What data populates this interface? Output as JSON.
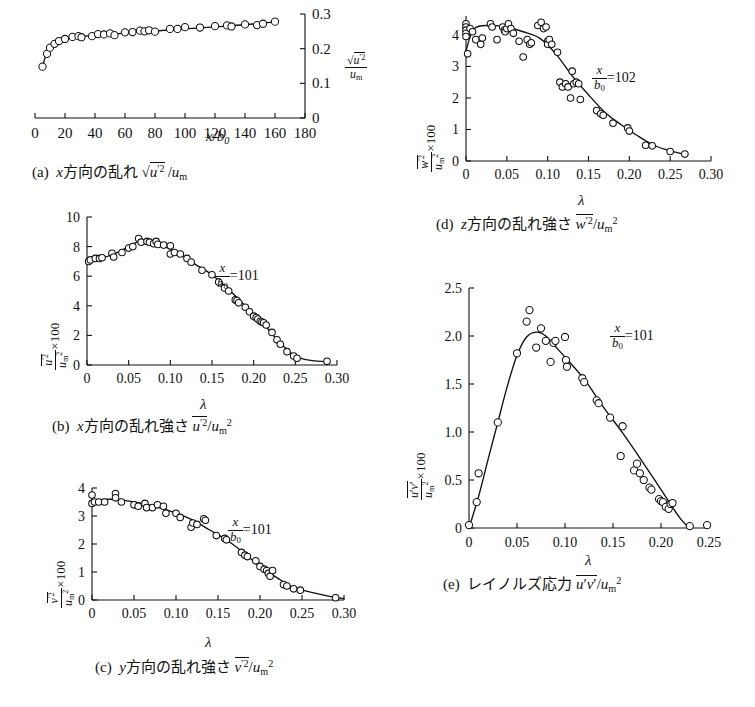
{
  "figure": {
    "background": "#ffffff",
    "line_color": "#111111",
    "marker": "open-circle",
    "width": 755,
    "height": 707
  },
  "panels": [
    {
      "id": "a",
      "caption_label": "(a)",
      "caption_text": "x方向の乱れ √u̅'² /u_m",
      "annotation": "",
      "ylabel": "√u̅'² / u_m",
      "xlabel": "x/b₀",
      "chart_data": {
        "type": "scatter",
        "title": "(a) x方向の乱れ √u'2/um",
        "xlabel": "x/b0",
        "ylabel": "sqrt(u'^2)/um",
        "xlim": [
          0,
          180
        ],
        "ylim": [
          0,
          0.3
        ],
        "xticks": [
          0,
          20,
          40,
          60,
          80,
          100,
          120,
          140,
          160,
          180
        ],
        "yticks": [
          0,
          0.1,
          0.2,
          0.3
        ],
        "grid": false,
        "legend": "none",
        "x": [
          5,
          8,
          10,
          13,
          16,
          20,
          25,
          29,
          31,
          38,
          42,
          46,
          50,
          53,
          60,
          65,
          70,
          73,
          76,
          80,
          90,
          95,
          100,
          110,
          120,
          128,
          131,
          140,
          148,
          152,
          160
        ],
        "y": [
          0.148,
          0.185,
          0.203,
          0.214,
          0.222,
          0.228,
          0.234,
          0.236,
          0.233,
          0.236,
          0.242,
          0.241,
          0.244,
          0.239,
          0.247,
          0.248,
          0.252,
          0.25,
          0.253,
          0.249,
          0.257,
          0.257,
          0.262,
          0.261,
          0.265,
          0.267,
          0.264,
          0.27,
          0.268,
          0.272,
          0.278
        ],
        "fit_x": [
          5,
          10,
          20,
          30,
          40,
          60,
          80,
          100,
          120,
          140,
          160
        ],
        "fit_y": [
          0.15,
          0.205,
          0.228,
          0.234,
          0.239,
          0.245,
          0.251,
          0.257,
          0.263,
          0.269,
          0.277
        ]
      }
    },
    {
      "id": "b",
      "caption_label": "(b)",
      "caption_text": "x方向の乱れ強さ u̅'²/u_m²",
      "annotation": "x/b₀ = 101",
      "annotation_value": "101",
      "ylabel": "u̅'²/u_m² ×100",
      "xlabel": "λ",
      "chart_data": {
        "type": "scatter",
        "title": "(b) x方向の乱れ強さ u'2/um2",
        "xlabel": "λ",
        "ylabel": "u'^2/um^2 x100",
        "xlim": [
          0,
          0.3
        ],
        "ylim": [
          0,
          10
        ],
        "xticks": [
          0,
          0.05,
          0.1,
          0.15,
          0.2,
          0.25,
          0.3
        ],
        "yticks": [
          0,
          2,
          4,
          6,
          8,
          10
        ],
        "grid": false,
        "legend": "none",
        "x": [
          0.002,
          0.004,
          0.01,
          0.015,
          0.018,
          0.03,
          0.032,
          0.042,
          0.05,
          0.055,
          0.062,
          0.065,
          0.072,
          0.075,
          0.08,
          0.083,
          0.085,
          0.092,
          0.1,
          0.1,
          0.105,
          0.112,
          0.12,
          0.125,
          0.138,
          0.15,
          0.158,
          0.165,
          0.17,
          0.178,
          0.18,
          0.182,
          0.19,
          0.195,
          0.2,
          0.203,
          0.205,
          0.208,
          0.21,
          0.212,
          0.215,
          0.222,
          0.228,
          0.232,
          0.24,
          0.248,
          0.252,
          0.288
        ],
        "y": [
          7.0,
          7.1,
          7.2,
          7.2,
          7.25,
          7.55,
          7.3,
          7.6,
          7.9,
          8.0,
          8.55,
          8.3,
          8.35,
          8.3,
          8.2,
          8.35,
          8.15,
          8.1,
          8.05,
          7.5,
          7.6,
          7.5,
          7.2,
          6.95,
          6.4,
          6.1,
          5.6,
          5.2,
          5.0,
          4.4,
          4.35,
          4.2,
          3.9,
          3.6,
          3.3,
          3.2,
          3.1,
          2.95,
          2.9,
          2.85,
          2.7,
          2.2,
          1.7,
          1.4,
          0.9,
          0.6,
          0.45,
          0.25
        ],
        "fit_x": [
          0,
          0.02,
          0.04,
          0.06,
          0.075,
          0.09,
          0.11,
          0.13,
          0.15,
          0.17,
          0.19,
          0.21,
          0.23,
          0.25,
          0.27,
          0.29
        ],
        "fit_y": [
          7.0,
          7.25,
          7.7,
          8.3,
          8.4,
          8.1,
          7.5,
          6.8,
          6.1,
          5.1,
          4.0,
          2.9,
          1.6,
          0.6,
          0.3,
          0.22
        ]
      }
    },
    {
      "id": "c",
      "caption_label": "(c)",
      "caption_text": "y方向の乱れ強さ v̅'²/u_m²",
      "annotation": "x/b₀ = 101",
      "annotation_value": "101",
      "ylabel": "v̅'²/u_m² ×100",
      "xlabel": "λ",
      "chart_data": {
        "type": "scatter",
        "title": "(c) y方向の乱れ強さ v'2/um2",
        "xlabel": "λ",
        "ylabel": "v'^2/um^2 x100",
        "xlim": [
          0,
          0.3
        ],
        "ylim": [
          0,
          4
        ],
        "xticks": [
          0,
          0.05,
          0.1,
          0.15,
          0.2,
          0.25,
          0.3
        ],
        "yticks": [
          0,
          1,
          2,
          3,
          4
        ],
        "grid": false,
        "legend": "none",
        "x": [
          0.0,
          0.0,
          0.003,
          0.008,
          0.015,
          0.028,
          0.028,
          0.035,
          0.05,
          0.055,
          0.063,
          0.065,
          0.072,
          0.078,
          0.085,
          0.088,
          0.1,
          0.105,
          0.118,
          0.12,
          0.125,
          0.133,
          0.135,
          0.148,
          0.158,
          0.16,
          0.178,
          0.182,
          0.185,
          0.195,
          0.2,
          0.205,
          0.208,
          0.21,
          0.212,
          0.215,
          0.228,
          0.232,
          0.24,
          0.248,
          0.29
        ],
        "y": [
          3.75,
          3.45,
          3.5,
          3.5,
          3.5,
          3.8,
          3.65,
          3.5,
          3.4,
          3.35,
          3.45,
          3.3,
          3.3,
          3.4,
          3.35,
          3.1,
          3.1,
          2.95,
          2.6,
          2.75,
          2.7,
          2.9,
          2.85,
          2.3,
          2.2,
          2.15,
          1.7,
          1.6,
          1.55,
          1.4,
          1.2,
          1.1,
          1.05,
          0.95,
          0.85,
          1.05,
          0.55,
          0.5,
          0.4,
          0.35,
          0.08
        ],
        "fit_x": [
          0,
          0.02,
          0.04,
          0.06,
          0.08,
          0.1,
          0.12,
          0.14,
          0.16,
          0.18,
          0.2,
          0.22,
          0.24,
          0.26,
          0.28,
          0.3
        ],
        "fit_y": [
          3.55,
          3.6,
          3.55,
          3.45,
          3.3,
          3.1,
          2.85,
          2.5,
          2.15,
          1.7,
          1.2,
          0.8,
          0.45,
          0.28,
          0.15,
          0.05
        ]
      }
    },
    {
      "id": "d",
      "caption_label": "(d)",
      "caption_text": "z方向の乱れ強さ w̅'²/u_m²",
      "annotation": "x/b₀ = 102",
      "annotation_value": "102",
      "ylabel": "w̅'²/u_m² ×100",
      "xlabel": "λ",
      "chart_data": {
        "type": "scatter",
        "title": "(d) z方向の乱れ強さ w'2/um2",
        "xlabel": "λ",
        "ylabel": "w'^2/um^2 x100",
        "xlim": [
          0,
          0.3
        ],
        "ylim": [
          0,
          4.6
        ],
        "xticks": [
          0,
          0.05,
          0.1,
          0.15,
          0.2,
          0.25,
          0.3
        ],
        "yticks": [
          0,
          1,
          2,
          3,
          4
        ],
        "grid": false,
        "legend": "none",
        "x": [
          0.0,
          0.0,
          0.0,
          0.0,
          0.0,
          0.002,
          0.005,
          0.008,
          0.012,
          0.018,
          0.02,
          0.03,
          0.032,
          0.038,
          0.045,
          0.047,
          0.048,
          0.05,
          0.052,
          0.055,
          0.058,
          0.065,
          0.07,
          0.075,
          0.078,
          0.08,
          0.088,
          0.092,
          0.095,
          0.098,
          0.1,
          0.1,
          0.102,
          0.105,
          0.112,
          0.115,
          0.118,
          0.122,
          0.125,
          0.128,
          0.13,
          0.132,
          0.135,
          0.138,
          0.14,
          0.16,
          0.165,
          0.168,
          0.18,
          0.198,
          0.2,
          0.22,
          0.228,
          0.25,
          0.268
        ],
        "y": [
          4.35,
          4.25,
          4.15,
          4.05,
          3.95,
          3.4,
          4.2,
          4.1,
          3.85,
          3.7,
          3.9,
          4.35,
          4.25,
          3.85,
          4.25,
          4.15,
          4.1,
          4.2,
          4.35,
          4.2,
          4.05,
          3.8,
          3.3,
          3.85,
          3.7,
          3.75,
          4.3,
          4.4,
          4.2,
          4.25,
          3.8,
          3.7,
          3.85,
          3.7,
          3.45,
          2.5,
          2.35,
          2.45,
          2.35,
          2.0,
          2.85,
          2.45,
          2.5,
          2.45,
          1.95,
          1.6,
          1.5,
          1.45,
          1.2,
          1.05,
          0.95,
          0.5,
          0.48,
          0.3,
          0.22
        ],
        "fit_x": [
          0,
          0.01,
          0.03,
          0.05,
          0.07,
          0.09,
          0.11,
          0.13,
          0.15,
          0.17,
          0.19,
          0.21,
          0.23,
          0.25,
          0.27
        ],
        "fit_y": [
          3.5,
          4.2,
          4.3,
          4.25,
          4.1,
          3.9,
          3.4,
          2.7,
          2.1,
          1.55,
          1.15,
          0.8,
          0.5,
          0.32,
          0.2
        ]
      }
    },
    {
      "id": "e",
      "caption_label": "(e)",
      "caption_text": "レイノルズ応力 u̅'v̅'/u_m²",
      "annotation": "x/b₀ = 101",
      "annotation_value": "101",
      "ylabel": "u̅'v̅'/u_m² ×100",
      "xlabel": "λ",
      "chart_data": {
        "type": "scatter",
        "title": "(e) レイノルズ応力 u'v'/um2",
        "xlabel": "λ",
        "ylabel": "u'v'/um^2 x100",
        "xlim": [
          0,
          0.25
        ],
        "ylim": [
          0,
          2.5
        ],
        "xticks": [
          0,
          0.05,
          0.1,
          0.15,
          0.2,
          0.25
        ],
        "yticks": [
          0,
          0.5,
          1.0,
          1.5,
          2.0,
          2.5
        ],
        "grid": false,
        "legend": "none",
        "x": [
          0.0,
          0.008,
          0.01,
          0.03,
          0.05,
          0.06,
          0.063,
          0.07,
          0.075,
          0.08,
          0.085,
          0.088,
          0.09,
          0.1,
          0.101,
          0.102,
          0.118,
          0.12,
          0.133,
          0.135,
          0.147,
          0.158,
          0.16,
          0.172,
          0.175,
          0.178,
          0.182,
          0.188,
          0.19,
          0.198,
          0.2,
          0.202,
          0.205,
          0.208,
          0.21,
          0.212,
          0.23,
          0.248
        ],
        "y": [
          0.03,
          0.27,
          0.57,
          1.1,
          1.82,
          2.15,
          2.27,
          1.88,
          2.08,
          1.95,
          1.73,
          1.93,
          1.95,
          1.99,
          1.75,
          1.68,
          1.56,
          1.52,
          1.33,
          1.3,
          1.15,
          0.75,
          1.06,
          0.6,
          0.67,
          0.57,
          0.5,
          0.42,
          0.4,
          0.3,
          0.28,
          0.27,
          0.22,
          0.2,
          0.25,
          0.26,
          0.02,
          0.03
        ],
        "fit_x": [
          0,
          0.01,
          0.02,
          0.03,
          0.04,
          0.05,
          0.06,
          0.07,
          0.08,
          0.09,
          0.1,
          0.12,
          0.14,
          0.16,
          0.18,
          0.2,
          0.22,
          0.23
        ],
        "fit_y": [
          0.0,
          0.33,
          0.72,
          1.1,
          1.48,
          1.8,
          1.99,
          2.04,
          2.0,
          1.89,
          1.78,
          1.55,
          1.26,
          0.99,
          0.7,
          0.4,
          0.1,
          0.0
        ]
      }
    }
  ]
}
